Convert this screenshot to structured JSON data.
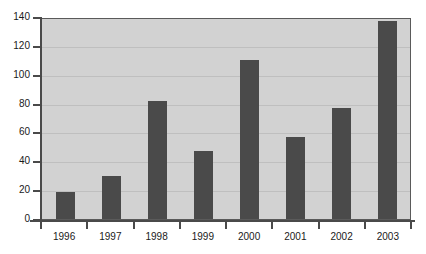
{
  "chart_data": {
    "type": "bar",
    "title": "",
    "subtitle": "",
    "xlabel": "",
    "ylabel": "",
    "categories": [
      "1996",
      "1997",
      "1998",
      "1999",
      "2000",
      "2001",
      "2002",
      "2003"
    ],
    "values": [
      19,
      30,
      82,
      47,
      110,
      57,
      77,
      137
    ],
    "ylim": [
      0,
      140
    ],
    "ytick_values": [
      0,
      20,
      40,
      60,
      80,
      100,
      120,
      140
    ],
    "ytick_labels": [
      "0",
      "20",
      "40",
      "60",
      "80",
      "100",
      "120",
      "140"
    ],
    "grid": true,
    "grid_axis": "y",
    "legend": null,
    "legend_position": "none",
    "bar_color": "#4a4a4a",
    "plot_background": "#d2d2d2",
    "figure_background": "#ffffff",
    "gridline_color": "#bfbfbf",
    "axis_color": "#4a4a4a",
    "tick_label_color": "#1a1a1a"
  }
}
